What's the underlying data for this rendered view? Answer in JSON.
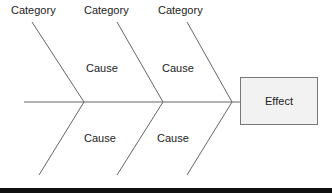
{
  "diagram": {
    "type": "fishbone",
    "effect": {
      "label": "Effect"
    },
    "categories": [
      {
        "label": "Category"
      },
      {
        "label": "Category"
      },
      {
        "label": "Category"
      }
    ],
    "causes_top": [
      {
        "label": "Cause"
      },
      {
        "label": "Cause"
      }
    ],
    "causes_bottom": [
      {
        "label": "Cause"
      },
      {
        "label": "Cause"
      }
    ],
    "colors": {
      "line": "#666666",
      "effect_fill": "#f2f2f2",
      "effect_border": "#777777",
      "text": "#222222",
      "bottom_bar": "#111111"
    }
  }
}
